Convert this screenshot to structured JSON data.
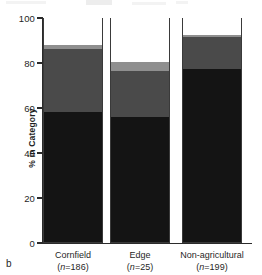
{
  "panel": {
    "letter": "b"
  },
  "chart_data": {
    "type": "bar",
    "subtype": "stacked-column",
    "title": "",
    "xlabel": "",
    "ylabel": "% in Category",
    "ylim": [
      0,
      100
    ],
    "yticks": [
      0,
      20,
      40,
      60,
      80,
      100
    ],
    "ytick_labels": [
      "0",
      "20",
      "40",
      "60",
      "80",
      "100"
    ],
    "grid": false,
    "legend": "none",
    "categories": [
      "Cornfield",
      "Edge",
      "Non-agricultural"
    ],
    "category_n": [
      "(n=186)",
      "(n=25)",
      "(n=199)"
    ],
    "category_n_values": [
      186,
      25,
      199
    ],
    "series": [
      {
        "name": "black",
        "color": "#141414",
        "values": [
          58.0,
          55.5,
          77.0
        ]
      },
      {
        "name": "dark-gray",
        "color": "#4a4a4a",
        "values": [
          28.0,
          20.5,
          14.0
        ]
      },
      {
        "name": "light-gray",
        "color": "#8f8f8f",
        "values": [
          1.5,
          4.0,
          1.0
        ]
      },
      {
        "name": "white",
        "color": "#ffffff",
        "values": [
          12.5,
          20.0,
          8.0
        ]
      }
    ],
    "cumulative_tops": {
      "Cornfield": [
        58.0,
        86.0,
        87.5,
        100.0
      ],
      "Edge": [
        55.5,
        76.0,
        80.0,
        100.0
      ],
      "Non-agricultural": [
        77.0,
        91.0,
        92.0,
        100.0
      ]
    }
  },
  "colors": {
    "axis": "#2b2b2b",
    "text": "#1f1f1f",
    "background": "#ffffff"
  }
}
